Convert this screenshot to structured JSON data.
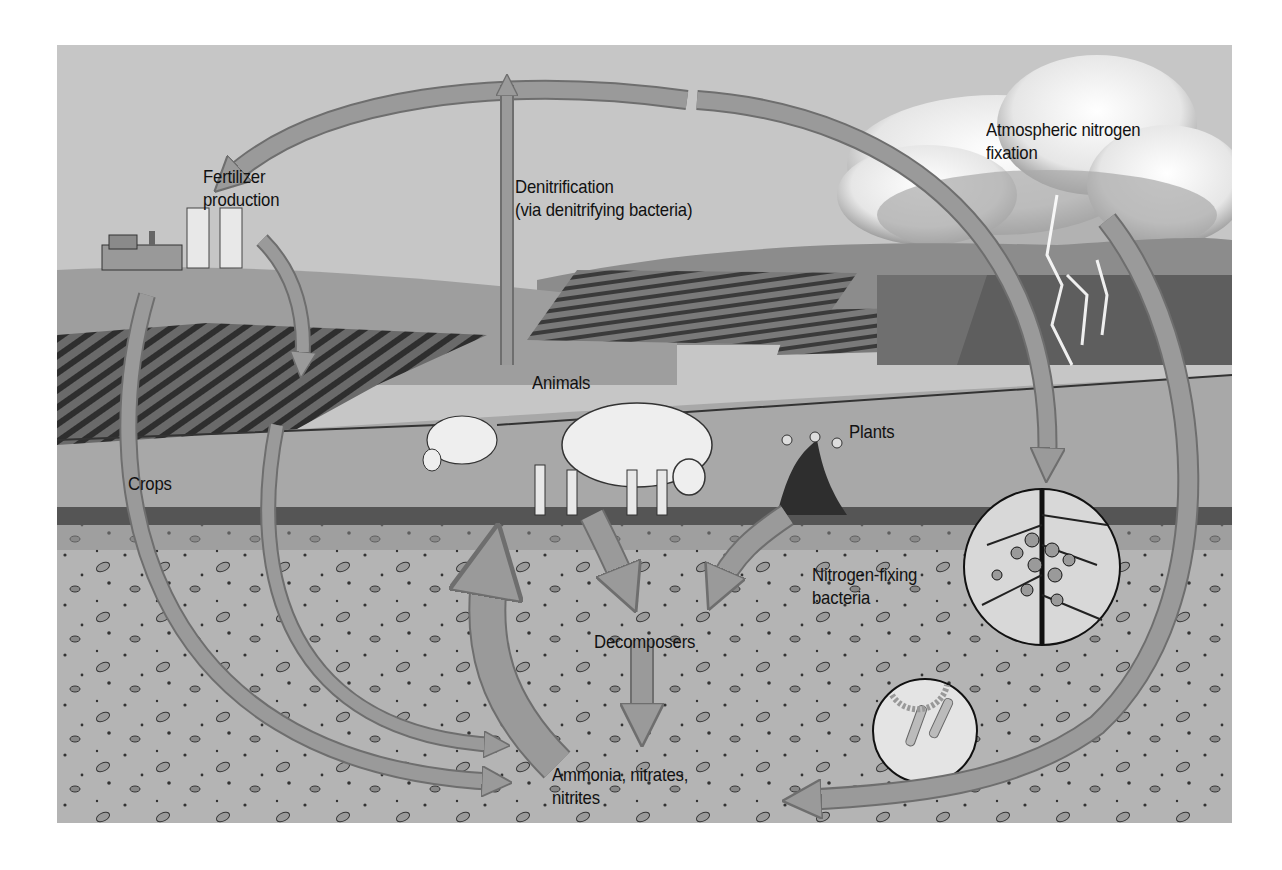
{
  "figure": {
    "colors": {
      "sky": "#c8c8c8",
      "cloud": "#f2f2f2",
      "hill_far": "#8a8a8a",
      "field_dark": "#4a4a4a",
      "pasture": "#a9a9a9",
      "soil": "#b3b3b3",
      "arrow_fill": "#9a9a9a",
      "arrow_edge": "#6e6e6e",
      "label_text": "#111111"
    }
  },
  "labels": {
    "fertilizer": {
      "line1": "Fertilizer",
      "line2": "production"
    },
    "denitrification": {
      "line1": "Denitrification",
      "line2": "(via denitrifying bacteria)"
    },
    "atmospheric": {
      "line1": "Atmospheric nitrogen",
      "line2": "fixation"
    },
    "animals": "Animals",
    "plants": "Plants",
    "crops": "Crops",
    "nitrogen_fixing": {
      "line1": "Nitrogen-fixing",
      "line2": "bacteria"
    },
    "decomposers": "Decomposers",
    "ammonia": {
      "line1": "Ammonia, nitrates,",
      "line2": "nitrites"
    }
  },
  "icons": {
    "factory": "factory-icon",
    "cloud": "cloud-icon",
    "lightning": "lightning-icon",
    "sheep": "sheep-icon",
    "plant": "plant-icon",
    "root_nodules_inset": "root-nodule-inset-icon",
    "bacteria_inset": "bacteria-inset-icon"
  }
}
